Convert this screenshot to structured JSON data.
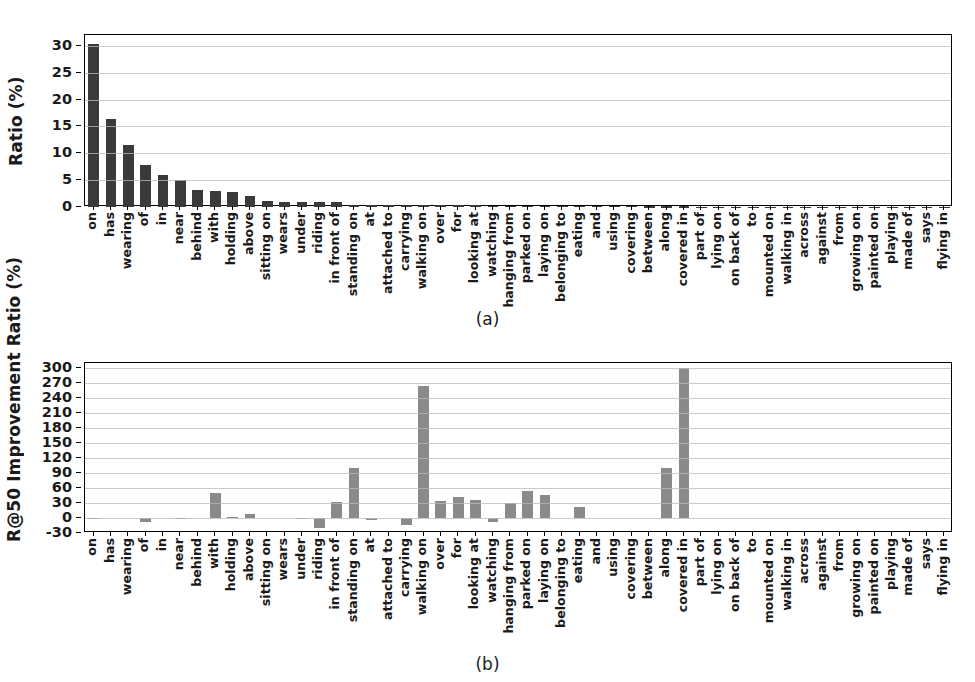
{
  "figure": {
    "background": "#ffffff",
    "panel_a_caption": "(a)",
    "panel_b_caption": "(b)"
  },
  "chart_data": [
    {
      "id": "panel-a",
      "type": "bar",
      "title": "",
      "caption": "(a)",
      "xlabel": "",
      "ylabel": "Ratio (%)",
      "ylim": [
        0,
        32
      ],
      "yticks": [
        0,
        5,
        10,
        15,
        20,
        25,
        30
      ],
      "grid": true,
      "legend": "none",
      "bar_color": "#3a3a3a",
      "categories": [
        "on",
        "has",
        "wearing",
        "of",
        "in",
        "near",
        "behind",
        "with",
        "holding",
        "above",
        "sitting on",
        "wears",
        "under",
        "riding",
        "in front of",
        "standing on",
        "at",
        "attached to",
        "carrying",
        "walking on",
        "over",
        "for",
        "looking at",
        "watching",
        "hanging from",
        "parked on",
        "laying on",
        "belonging to",
        "eating",
        "and",
        "using",
        "covering",
        "between",
        "along",
        "covered in",
        "part of",
        "lying on",
        "on back of",
        "to",
        "mounted on",
        "walking in",
        "across",
        "against",
        "from",
        "growing on",
        "painted on",
        "playing",
        "made of",
        "says",
        "flying in"
      ],
      "values": [
        30.4,
        16.4,
        11.6,
        7.8,
        6.0,
        5.1,
        3.1,
        2.9,
        2.7,
        2.0,
        1.1,
        1.0,
        1.0,
        0.85,
        0.85,
        0.45,
        0.4,
        0.35,
        0.35,
        0.35,
        0.3,
        0.3,
        0.28,
        0.26,
        0.22,
        0.2,
        0.2,
        0.18,
        0.17,
        0.16,
        0.14,
        0.13,
        0.12,
        0.11,
        0.1,
        0.09,
        0.08,
        0.07,
        0.07,
        0.06,
        0.05,
        0.05,
        0.04,
        0.04,
        0.03,
        0.03,
        0.02,
        0.02,
        0.02,
        0.01
      ]
    },
    {
      "id": "panel-b",
      "type": "bar",
      "title": "",
      "caption": "(b)",
      "xlabel": "",
      "ylabel": "R@50 Improvement Ratio (%)",
      "ylim": [
        -30,
        310
      ],
      "yticks": [
        -30,
        0,
        30,
        60,
        90,
        120,
        150,
        180,
        210,
        240,
        270,
        300
      ],
      "grid": true,
      "legend": "none",
      "bar_color": "#8a8a8a",
      "categories": [
        "on",
        "has",
        "wearing",
        "of",
        "in",
        "near",
        "behind",
        "with",
        "holding",
        "above",
        "sitting on",
        "wears",
        "under",
        "riding",
        "in front of",
        "standing on",
        "at",
        "attached to",
        "carrying",
        "walking on",
        "over",
        "for",
        "looking at",
        "watching",
        "hanging from",
        "parked on",
        "laying on",
        "belonging to",
        "eating",
        "and",
        "using",
        "covering",
        "between",
        "along",
        "covered in",
        "part of",
        "lying on",
        "on back of",
        "to",
        "mounted on",
        "walking in",
        "across",
        "against",
        "from",
        "growing on",
        "painted on",
        "playing",
        "made of",
        "says",
        "flying in"
      ],
      "values": [
        1,
        0,
        0,
        -7,
        0,
        1,
        0,
        50,
        2,
        8,
        0,
        0,
        -2,
        -20,
        32,
        100,
        -4,
        0,
        -14,
        265,
        34,
        43,
        36,
        -7,
        30,
        55,
        47,
        0,
        22,
        0,
        0,
        0,
        0,
        101,
        300,
        0,
        0,
        0,
        0,
        0,
        0,
        0,
        0,
        0,
        0,
        0,
        0,
        0,
        0,
        0
      ]
    }
  ]
}
